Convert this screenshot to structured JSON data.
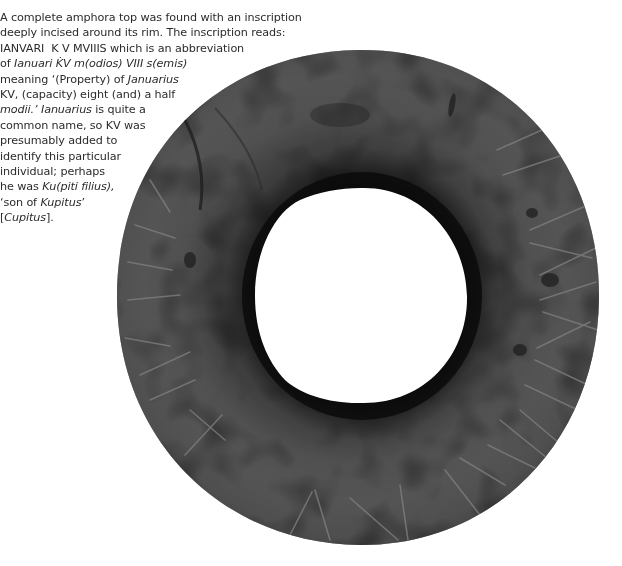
{
  "caption": {
    "lines": [
      [
        {
          "t": "A complete amphora top was found with an inscription",
          "i": false
        }
      ],
      [
        {
          "t": "deeply incised around its rim. The inscription reads:",
          "i": false
        }
      ],
      [
        {
          "t": "IANVARI  K V MVIIIS which is an abbreviation",
          "i": false
        }
      ],
      [
        {
          "t": "of ",
          "i": false
        },
        {
          "t": "Ianuari K̇V m(odios) VIII s(emis)",
          "i": true
        }
      ],
      [
        {
          "t": "meaning ‘(Property) of ",
          "i": false
        },
        {
          "t": "Januarius",
          "i": true
        }
      ],
      [
        {
          "t": "KV, (capacity) eight (and) a half",
          "i": false
        }
      ],
      [
        {
          "t": "modii.’ Ianuarius",
          "i": true
        },
        {
          "t": " is quite a",
          "i": false
        }
      ],
      [
        {
          "t": "common name, so KV was",
          "i": false
        }
      ],
      [
        {
          "t": "presumably added to",
          "i": false
        }
      ],
      [
        {
          "t": "identify this particular",
          "i": false
        }
      ],
      [
        {
          "t": "individual; perhaps",
          "i": false
        }
      ],
      [
        {
          "t": "he was ",
          "i": false
        },
        {
          "t": "Ku(piti filius),",
          "i": true
        }
      ],
      [
        {
          "t": "‘son of ",
          "i": false
        },
        {
          "t": "Kupitus",
          "i": true
        },
        {
          "t": "’",
          "i": false
        }
      ],
      [
        {
          "t": "[",
          "i": false
        },
        {
          "t": "Cupitus",
          "i": true
        },
        {
          "t": "].",
          "i": false
        }
      ]
    ]
  },
  "figure": {
    "colors": {
      "background": "#ffffff",
      "ring_light": "#5e5e5e",
      "ring_mid": "#474747",
      "ring_dark": "#262626",
      "inner_band": "#0e0e0e",
      "incision": "#7a7a7a",
      "text": "#2b2b2b"
    }
  }
}
